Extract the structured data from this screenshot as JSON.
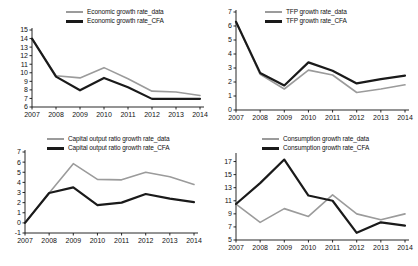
{
  "figure": {
    "background": "#ffffff",
    "series_colors": {
      "data": "#9b9b9b",
      "cfa": "#1a1a1a"
    }
  },
  "panels": [
    {
      "name": "economic-growth-rate",
      "legend": {
        "data_label": "Economic growth rate_data",
        "cfa_label": "Economic growth rate_CFA"
      }
    },
    {
      "name": "tfp-growth-rate",
      "legend": {
        "data_label": "TFP growth rate_data",
        "cfa_label": "TFP growth rate_CFA"
      }
    },
    {
      "name": "capital-output-ratio-growth-rate",
      "legend": {
        "data_label": "Capital output ratio growth rate_data",
        "cfa_label": "Capital output ratio growth rate_CFA"
      }
    },
    {
      "name": "consumption-growth-rate",
      "legend": {
        "data_label": "Consumption growth rate_data",
        "cfa_label": "Consumption growth rate_CFA"
      }
    }
  ],
  "chart_data": [
    {
      "type": "line",
      "title": "",
      "panel": "top-left",
      "xlabel": "",
      "ylabel": "",
      "x": [
        2007,
        2008,
        2009,
        2010,
        2011,
        2012,
        2013,
        2014
      ],
      "categories": [
        "2007",
        "2008",
        "2009",
        "2010",
        "2011",
        "2012",
        "2013",
        "2014"
      ],
      "xticklabels": [
        "2007",
        "2008",
        "2009",
        "2010",
        "2011",
        "2012",
        "2013",
        "2014"
      ],
      "yticks": [
        6,
        7,
        8,
        9,
        10,
        11,
        12,
        13,
        14,
        15
      ],
      "yticklabels": [
        "6",
        "7",
        "8",
        "9",
        "10",
        "11",
        "12",
        "13",
        "14",
        "15"
      ],
      "ylim": [
        6,
        15
      ],
      "xlim": [
        2007,
        2014
      ],
      "grid": false,
      "legend_position": "top-center",
      "series": [
        {
          "name": "Economic growth rate_data",
          "color": "#9b9b9b",
          "width": 1.6,
          "values": [
            14.0,
            9.65,
            9.4,
            10.6,
            9.3,
            7.85,
            7.75,
            7.35
          ]
        },
        {
          "name": "Economic growth rate_CFA",
          "color": "#1a1a1a",
          "width": 2.2,
          "values": [
            14.0,
            9.55,
            7.95,
            9.4,
            8.3,
            6.95,
            6.95,
            6.95
          ]
        }
      ]
    },
    {
      "type": "line",
      "title": "",
      "panel": "top-right",
      "xlabel": "",
      "ylabel": "",
      "x": [
        2007,
        2008,
        2009,
        2010,
        2011,
        2012,
        2013,
        2014
      ],
      "categories": [
        "2007",
        "2008",
        "2009",
        "2010",
        "2011",
        "2012",
        "2013",
        "2014"
      ],
      "xticklabels": [
        "2007",
        "2008",
        "2009",
        "2010",
        "2011",
        "2012",
        "2013",
        "2014"
      ],
      "yticks": [
        0,
        1,
        2,
        3,
        4,
        5,
        6,
        7
      ],
      "yticklabels": [
        "0",
        "1",
        "2",
        "3",
        "4",
        "5",
        "6",
        "7"
      ],
      "ylim": [
        0,
        7
      ],
      "xlim": [
        2007,
        2014
      ],
      "grid": false,
      "legend_position": "top-center",
      "series": [
        {
          "name": "TFP growth rate_data",
          "color": "#9b9b9b",
          "width": 1.6,
          "values": [
            6.3,
            2.55,
            1.5,
            2.85,
            2.5,
            1.25,
            1.5,
            1.8
          ]
        },
        {
          "name": "TFP growth rate_CFA",
          "color": "#1a1a1a",
          "width": 2.2,
          "values": [
            6.3,
            2.65,
            1.75,
            3.4,
            2.8,
            1.9,
            2.2,
            2.45
          ]
        }
      ]
    },
    {
      "type": "line",
      "title": "",
      "panel": "bottom-left",
      "xlabel": "",
      "ylabel": "",
      "x": [
        2007,
        2008,
        2009,
        2010,
        2011,
        2012,
        2013,
        2014
      ],
      "categories": [
        "2007",
        "2008",
        "2009",
        "2010",
        "2011",
        "2012",
        "2013",
        "2014"
      ],
      "xticklabels": [
        "2007",
        "2008",
        "2009",
        "2010",
        "2011",
        "2012",
        "2013",
        "2014"
      ],
      "yticks": [
        -1,
        0,
        1,
        2,
        3,
        4,
        5,
        6,
        7
      ],
      "yticklabels": [
        "-1",
        "0",
        "1",
        "2",
        "3",
        "4",
        "5",
        "6",
        "7"
      ],
      "ylim": [
        -1,
        7
      ],
      "xlim": [
        2007,
        2014
      ],
      "grid": false,
      "legend_position": "top-center",
      "series": [
        {
          "name": "Capital output ratio growth rate_data",
          "color": "#9b9b9b",
          "width": 1.6,
          "values": [
            0.0,
            2.95,
            5.85,
            4.3,
            4.25,
            5.0,
            4.55,
            3.8
          ]
        },
        {
          "name": "Capital output ratio growth rate_CFA",
          "color": "#1a1a1a",
          "width": 2.2,
          "values": [
            0.0,
            2.95,
            3.5,
            1.75,
            2.0,
            2.85,
            2.4,
            2.05
          ]
        }
      ]
    },
    {
      "type": "line",
      "title": "",
      "panel": "bottom-right",
      "xlabel": "",
      "ylabel": "",
      "x": [
        2007,
        2008,
        2009,
        2010,
        2011,
        2012,
        2013,
        2014
      ],
      "categories": [
        "2007",
        "2008",
        "2009",
        "2010",
        "2011",
        "2012",
        "2013",
        "2014"
      ],
      "xticklabels": [
        "2007",
        "2008",
        "2009",
        "2010",
        "2011",
        "2012",
        "2013",
        "2014"
      ],
      "yticks": [
        5,
        7,
        9,
        11,
        13,
        15,
        17
      ],
      "yticklabels": [
        "5",
        "7",
        "9",
        "11",
        "13",
        "15",
        "17"
      ],
      "ylim": [
        5,
        18
      ],
      "xlim": [
        2007,
        2014
      ],
      "grid": false,
      "legend_position": "top-center",
      "series": [
        {
          "name": "Consumption growth rate_data",
          "color": "#9b9b9b",
          "width": 1.6,
          "values": [
            10.5,
            7.7,
            9.8,
            8.6,
            11.9,
            9.0,
            8.1,
            9.0
          ]
        },
        {
          "name": "Consumption growth rate_CFA",
          "color": "#1a1a1a",
          "width": 2.2,
          "values": [
            10.5,
            13.7,
            17.3,
            11.8,
            11.0,
            6.1,
            7.7,
            7.2
          ]
        }
      ]
    }
  ]
}
